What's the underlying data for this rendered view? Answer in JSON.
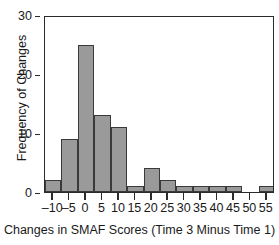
{
  "chart_data": {
    "type": "bar",
    "title": "",
    "xlabel": "Changes in SMAF Scores (Time 3 Minus Time 1)",
    "ylabel": "Frequency of Changes",
    "xlim": [
      -12.5,
      57.5
    ],
    "ylim": [
      0,
      30
    ],
    "grid": false,
    "legend": null,
    "bin_width": 5,
    "xticks": [
      -10,
      -5,
      0,
      5,
      10,
      15,
      20,
      25,
      30,
      35,
      40,
      45,
      50,
      55
    ],
    "xtick_labels": [
      "–10",
      "–5",
      "0",
      "5",
      "10",
      "15",
      "20",
      "25",
      "30",
      "35",
      "40",
      "45",
      "50",
      "55"
    ],
    "yticks": [
      0,
      10,
      20,
      30
    ],
    "ytick_labels": [
      "0",
      "10",
      "20",
      "30"
    ],
    "bin_edges": [
      -12.5,
      -7.5,
      -2.5,
      2.5,
      7.5,
      12.5,
      17.5,
      22.5,
      27.5,
      32.5,
      37.5,
      42.5,
      47.5,
      52.5,
      57.5
    ],
    "categories": [
      "-12.5 to -7.5",
      "-7.5 to -2.5",
      "-2.5 to 2.5",
      "2.5 to 7.5",
      "7.5 to 12.5",
      "12.5 to 17.5",
      "17.5 to 22.5",
      "22.5 to 27.5",
      "27.5 to 32.5",
      "32.5 to 37.5",
      "37.5 to 42.5",
      "42.5 to 47.5",
      "47.5 to 52.5",
      "52.5 to 57.5"
    ],
    "values": [
      2,
      9,
      25,
      13,
      11,
      1,
      4,
      2,
      1,
      1,
      1,
      1,
      0,
      1
    ],
    "bar_fill_color": "#9a9a9a",
    "bar_edge_color": "#3a3a3a",
    "axis_color": "#2b2b2b"
  }
}
